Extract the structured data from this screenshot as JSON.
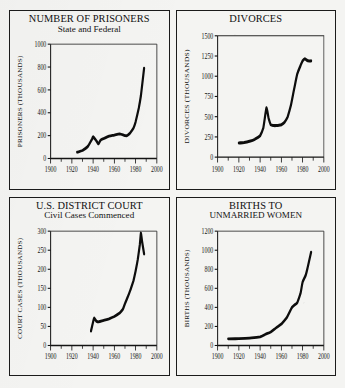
{
  "sheet": {
    "background_color": "#f4f4f2",
    "ink_color": "#0d0d0d"
  },
  "panels": [
    {
      "name": "prisoners",
      "title_main": "NUMBER OF PRISONERS",
      "title_sub": "State and Federal"
    },
    {
      "name": "divorces",
      "title_main": "DIVORCES",
      "title_sub": ""
    },
    {
      "name": "court-cases",
      "title_main": "U.S. DISTRICT COURT",
      "title_sub": "Civil Cases Commenced"
    },
    {
      "name": "births",
      "title_main": "BIRTHS TO",
      "title_sub": "UNMARRIED WOMEN"
    }
  ],
  "chart_data": [
    {
      "type": "line",
      "title": "NUMBER OF PRISONERS",
      "subtitle": "State and Federal",
      "xlabel": "",
      "ylabel": "PRISONERS (THOUSANDS)",
      "xlim": [
        1900,
        2000
      ],
      "ylim": [
        0,
        1000
      ],
      "xticks": [
        1900,
        1920,
        1940,
        1960,
        1980,
        2000
      ],
      "xtick_labels": [
        "1900",
        "1920",
        "1940",
        "1960",
        "1980",
        "2000"
      ],
      "xminor_step": 10,
      "yticks": [
        0,
        200,
        400,
        600,
        800,
        1000
      ],
      "ytick_labels": [
        "0",
        "200",
        "400",
        "600",
        "800",
        "1000"
      ],
      "grid": false,
      "legend": "none",
      "series": [
        {
          "name": "prisoners",
          "x": [
            1925,
            1930,
            1935,
            1939,
            1940,
            1943,
            1945,
            1947,
            1950,
            1955,
            1960,
            1965,
            1970,
            1972,
            1975,
            1978,
            1980,
            1983,
            1985,
            1988
          ],
          "y": [
            55,
            70,
            105,
            170,
            190,
            155,
            128,
            160,
            175,
            195,
            205,
            215,
            200,
            200,
            225,
            265,
            320,
            440,
            550,
            790
          ]
        }
      ]
    },
    {
      "type": "line",
      "title": "DIVORCES",
      "subtitle": "",
      "xlabel": "",
      "ylabel": "DIVORCES (THOUSANDS)",
      "xlim": [
        1900,
        2000
      ],
      "ylim": [
        0,
        1500
      ],
      "xticks": [
        1900,
        1920,
        1940,
        1960,
        1980,
        2000
      ],
      "xtick_labels": [
        "1900",
        "1920",
        "1940",
        "1960",
        "1980",
        "2000"
      ],
      "xminor_step": 10,
      "yticks": [
        0,
        250,
        500,
        750,
        1000,
        1250,
        1500
      ],
      "ytick_labels": [
        "0",
        "250",
        "500",
        "750",
        "1000",
        "1250",
        "1500"
      ],
      "grid": false,
      "legend": "none",
      "series": [
        {
          "name": "divorces",
          "x": [
            1920,
            1925,
            1930,
            1935,
            1940,
            1943,
            1946,
            1948,
            1950,
            1953,
            1955,
            1958,
            1960,
            1963,
            1966,
            1969,
            1972,
            1975,
            1978,
            1980,
            1982,
            1985,
            1988
          ],
          "y": [
            175,
            180,
            195,
            220,
            265,
            360,
            610,
            480,
            400,
            390,
            390,
            395,
            400,
            430,
            500,
            640,
            840,
            1030,
            1130,
            1190,
            1215,
            1190,
            1190
          ]
        }
      ]
    },
    {
      "type": "line",
      "title": "U.S. DISTRICT COURT",
      "subtitle": "Civil Cases Commenced",
      "xlabel": "",
      "ylabel": "COURT CASES (THOUSANDS)",
      "xlim": [
        1900,
        2000
      ],
      "ylim": [
        0,
        300
      ],
      "xticks": [
        1900,
        1920,
        1940,
        1960,
        1980,
        2000
      ],
      "xtick_labels": [
        "1900",
        "1920",
        "1940",
        "1960",
        "1980",
        "2000"
      ],
      "xminor_step": 10,
      "yticks": [
        0,
        50,
        100,
        150,
        200,
        250,
        300
      ],
      "ytick_labels": [
        "0",
        "50",
        "100",
        "150",
        "200",
        "250",
        "300"
      ],
      "grid": false,
      "legend": "none",
      "series": [
        {
          "name": "civil-cases",
          "x": [
            1938,
            1940,
            1941,
            1943,
            1945,
            1950,
            1955,
            1960,
            1965,
            1968,
            1970,
            1973,
            1975,
            1978,
            1980,
            1982,
            1984,
            1985,
            1986,
            1988
          ],
          "y": [
            38,
            62,
            72,
            64,
            62,
            66,
            70,
            76,
            85,
            95,
            110,
            130,
            145,
            170,
            195,
            225,
            265,
            295,
            275,
            240
          ]
        }
      ]
    },
    {
      "type": "line",
      "title": "BIRTHS TO UNMARRIED WOMEN",
      "subtitle": "",
      "xlabel": "",
      "ylabel": "BIRTHS (THOUSANDS)",
      "xlim": [
        1900,
        2000
      ],
      "ylim": [
        0,
        1200
      ],
      "xticks": [
        1900,
        1920,
        1940,
        1960,
        1980,
        2000
      ],
      "xtick_labels": [
        "1900",
        "1920",
        "1940",
        "1960",
        "1980",
        "2000"
      ],
      "xminor_step": 10,
      "yticks": [
        0,
        200,
        400,
        600,
        800,
        1000,
        1200
      ],
      "ytick_labels": [
        "0",
        "200",
        "400",
        "600",
        "800",
        "1000",
        "1200"
      ],
      "grid": false,
      "legend": "none",
      "series": [
        {
          "name": "births-unmarried",
          "x": [
            1910,
            1920,
            1930,
            1940,
            1945,
            1950,
            1955,
            1960,
            1965,
            1970,
            1973,
            1975,
            1978,
            1980,
            1983,
            1985,
            1987,
            1988
          ],
          "y": [
            70,
            72,
            78,
            90,
            118,
            142,
            185,
            225,
            290,
            400,
            430,
            450,
            545,
            665,
            740,
            830,
            930,
            980
          ]
        }
      ]
    }
  ]
}
